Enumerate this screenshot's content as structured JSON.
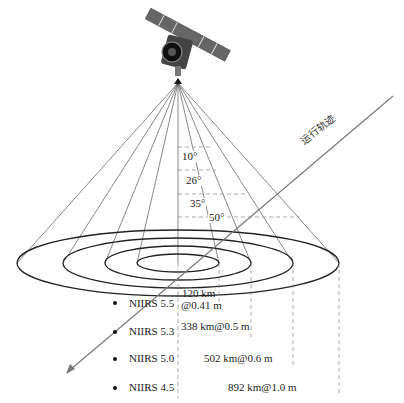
{
  "diagram": {
    "type": "satellite-imaging-swath-diagram",
    "satellite": {
      "icon": "satellite-icon",
      "apex": [
        178,
        83
      ]
    },
    "orbit": {
      "label": "运行轨迹",
      "start": [
        393,
        96
      ],
      "end": [
        68,
        372
      ],
      "color": "#777777"
    },
    "angles": [
      {
        "label": "10°",
        "x": 182,
        "y": 153
      },
      {
        "label": "26°",
        "x": 186,
        "y": 177
      },
      {
        "label": "35°",
        "x": 190,
        "y": 200
      },
      {
        "label": "50°",
        "x": 210,
        "y": 218
      }
    ],
    "angle_dash_lines": [
      {
        "y": 147,
        "x2": 213
      },
      {
        "y": 170,
        "x2": 216
      },
      {
        "y": 194,
        "x2": 248
      },
      {
        "y": 217,
        "x2": 300
      }
    ],
    "ellipses": [
      {
        "rx": 161,
        "ry": 33
      },
      {
        "rx": 115,
        "ry": 25
      },
      {
        "rx": 73,
        "ry": 17
      },
      {
        "rx": 41,
        "ry": 9
      }
    ],
    "ellipse_center": [
      178,
      263
    ],
    "rays_left_x": [
      17,
      63,
      105,
      137
    ],
    "rays_right_x": [
      219,
      251,
      293,
      339
    ],
    "levels": [
      {
        "niirs": "NIIRS 5.5",
        "swath": "120 km",
        "resolution": "@0.41 m",
        "row_y": 304
      },
      {
        "niirs": "NIIRS 5.3",
        "swath": "338 km@0.5 m",
        "resolution": "",
        "row_y": 331
      },
      {
        "niirs": "NIIRS 5.0",
        "swath": "502 km@0.6 m",
        "resolution": "",
        "row_y": 359
      },
      {
        "niirs": "NIIRS 4.5",
        "swath": "892 km@1.0  m",
        "resolution": "",
        "row_y": 388
      }
    ],
    "colors": {
      "line": "#555555",
      "ellipse": "#222222",
      "dash": "#888888"
    }
  }
}
